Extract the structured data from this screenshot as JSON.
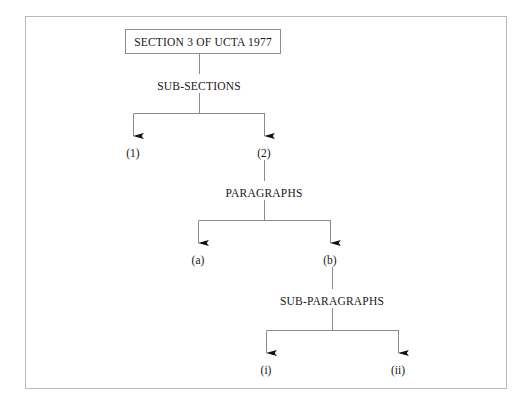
{
  "diagram": {
    "type": "hierarchy-tree",
    "root": {
      "label": "SECTION 3 OF UCTA 1977",
      "shape": "box"
    },
    "levels": [
      {
        "heading": "SUB-SECTIONS",
        "children": [
          "(1)",
          "(2)"
        ]
      },
      {
        "heading": "PARAGRAPHS",
        "children": [
          "(a)",
          "(b)"
        ]
      },
      {
        "heading": "SUB-PARAGRAPHS",
        "children": [
          "(i)",
          "(ii)"
        ]
      }
    ],
    "colors": {
      "frame_border": "#b9b9b9",
      "box_border": "#8d8d8d",
      "connector": "#8a8a8a",
      "arrow_fill": "#111111",
      "text": "#171717",
      "background": "#ffffff"
    }
  }
}
